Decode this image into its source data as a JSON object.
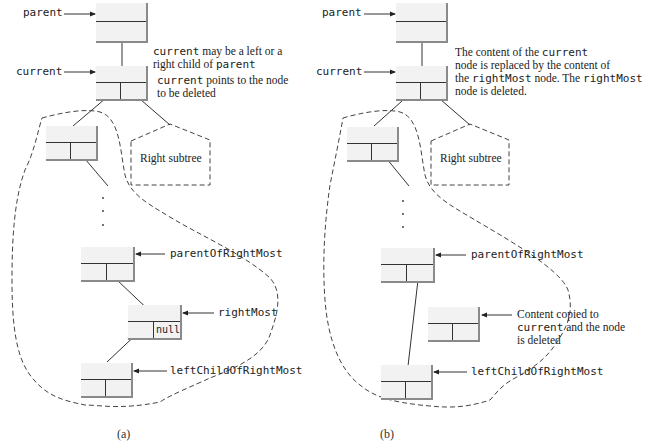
{
  "diagram_a": {
    "caption": "(a)",
    "labels": {
      "parent": "parent",
      "current": "current",
      "parentOfRightMost": "parentOfRightMost",
      "rightMost": "rightMost",
      "leftChildOfRightMost": "leftChildOfRightMost"
    },
    "notes": {
      "note1_code": "current",
      "note1_text_a": " may be a left or a",
      "note1_text_b": "right child of ",
      "note1_code2": "parent",
      "note2_code": "current",
      "note2_text_a": " points to the node",
      "note2_text_b": "to be deleted"
    },
    "right_subtree": "Right subtree",
    "null_value": "null"
  },
  "diagram_b": {
    "caption": "(b)",
    "labels": {
      "parent": "parent",
      "current": "current",
      "parentOfRightMost": "parentOfRightMost",
      "leftChildOfRightMost": "leftChildOfRightMost"
    },
    "notes": {
      "line1_text": "The content of the ",
      "line1_code": "current",
      "line2_text": "node is replaced by the content of",
      "line3_text_a": "the ",
      "line3_code": "rightMost",
      "line3_text_b": " node. The ",
      "line3_code2": "rightMost",
      "line4_text": "node is deleted.",
      "copied_line1": "Content copied to",
      "copied_code": "current",
      "copied_line2b": " and the node",
      "copied_line3": "is deleted"
    },
    "right_subtree": "Right subtree"
  },
  "colors": {
    "node_fill": "#f2f2f2",
    "node_shadow": "#8a8a8a",
    "line": "#333333",
    "dash": "#444444"
  }
}
